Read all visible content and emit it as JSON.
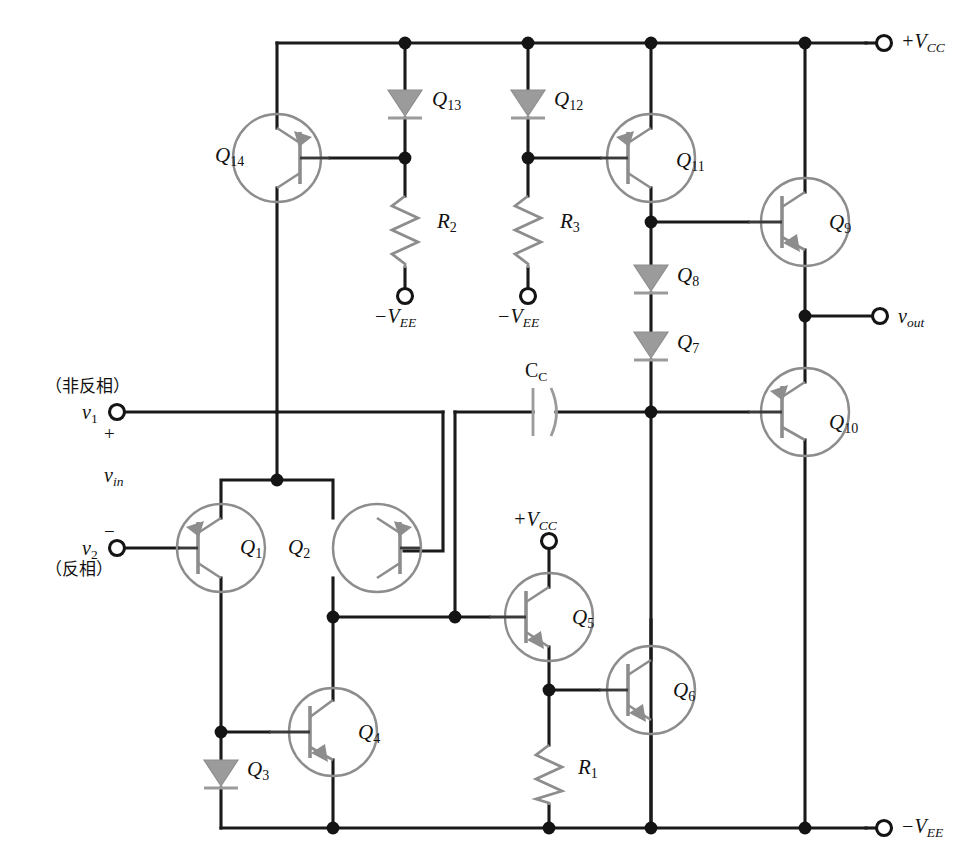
{
  "diagram": {
    "type": "circuit-schematic",
    "colors": {
      "wire": "#1a1a1a",
      "device": "#8d8d8d",
      "background": "#ffffff",
      "node": "#141414"
    }
  },
  "rails": {
    "vcc_top_label": "+V",
    "vcc_top_sub": "CC",
    "vee_bottom_label": "−V",
    "vee_bottom_sub": "EE",
    "vee_r2_label": "−V",
    "vee_r2_sub": "EE",
    "vee_r3_label": "−V",
    "vee_r3_sub": "EE",
    "vcc_q5_label": "+V",
    "vcc_q5_sub": "CC"
  },
  "inputs": {
    "noninverting_cn": "（非反相）",
    "inverting_cn": "（反相）",
    "v1_label": "v",
    "v1_sub": "1",
    "v2_label": "v",
    "v2_sub": "2",
    "plus_sign": "+",
    "minus_sign": "−",
    "vin_label": "v",
    "vin_sub": "in"
  },
  "output": {
    "vout_label": "v",
    "vout_sub": "out"
  },
  "transistors": [
    {
      "id": "Q1",
      "label": "Q",
      "sub": "1",
      "type": "pnp",
      "role": "diff-pair-left"
    },
    {
      "id": "Q2",
      "label": "Q",
      "sub": "2",
      "type": "pnp",
      "role": "diff-pair-right"
    },
    {
      "id": "Q4",
      "label": "Q",
      "sub": "4",
      "type": "npn",
      "role": "current-mirror"
    },
    {
      "id": "Q5",
      "label": "Q",
      "sub": "5",
      "type": "npn",
      "role": "gain-stage"
    },
    {
      "id": "Q6",
      "label": "Q",
      "sub": "6",
      "type": "npn",
      "role": "gain-stage"
    },
    {
      "id": "Q9",
      "label": "Q",
      "sub": "9",
      "type": "npn",
      "role": "output-upper"
    },
    {
      "id": "Q10",
      "label": "Q",
      "sub": "10",
      "type": "pnp",
      "role": "output-lower"
    },
    {
      "id": "Q11",
      "label": "Q",
      "sub": "11",
      "type": "pnp",
      "role": "current-source"
    },
    {
      "id": "Q14",
      "label": "Q",
      "sub": "14",
      "type": "pnp",
      "role": "current-source"
    }
  ],
  "diodes": [
    {
      "id": "Q3",
      "label": "Q",
      "sub": "3"
    },
    {
      "id": "Q7",
      "label": "Q",
      "sub": "7"
    },
    {
      "id": "Q8",
      "label": "Q",
      "sub": "8"
    },
    {
      "id": "Q12",
      "label": "Q",
      "sub": "12"
    },
    {
      "id": "Q13",
      "label": "Q",
      "sub": "13"
    }
  ],
  "resistors": [
    {
      "id": "R1",
      "label": "R",
      "sub": "1"
    },
    {
      "id": "R2",
      "label": "R",
      "sub": "2"
    },
    {
      "id": "R3",
      "label": "R",
      "sub": "3"
    }
  ],
  "capacitors": [
    {
      "id": "CC",
      "label": "C",
      "sub": "C"
    }
  ]
}
